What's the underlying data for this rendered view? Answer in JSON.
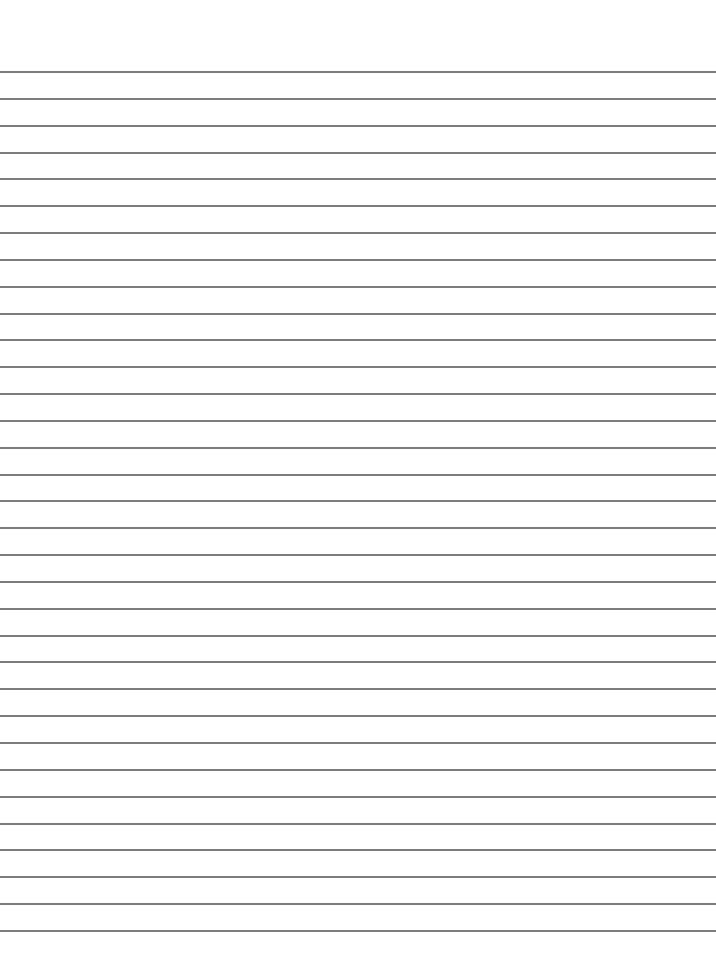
{
  "page": {
    "type": "lined-paper",
    "background_color": "#ffffff",
    "rule_color": "#6e6e6e",
    "rule_count": 33,
    "first_rule_y": 71,
    "rule_spacing": 26.84,
    "rule_thickness": 2
  }
}
